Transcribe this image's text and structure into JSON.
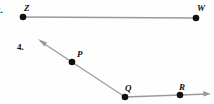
{
  "page": {
    "background_color": "#fefefe",
    "width": 214,
    "height": 104
  },
  "style": {
    "line_color": "#9a9a9a",
    "point_color": "#111111",
    "label_color": "#111111",
    "line_width": 1.3,
    "point_radius": 3.2
  },
  "problems": [
    {
      "number": "2.",
      "number_clipped": true,
      "figure_type": "segment",
      "points": [
        {
          "label": "Z",
          "x": 23,
          "y": 17,
          "label_x": 24,
          "label_y": 4
        },
        {
          "label": "W",
          "x": 196,
          "y": 18,
          "label_x": 197,
          "label_y": 4
        }
      ],
      "arrows": []
    },
    {
      "number": "4.",
      "number_clipped": false,
      "number_x": 17,
      "number_y": 43,
      "figure_type": "bent-ray",
      "points": [
        {
          "label": "P",
          "x": 72,
          "y": 62,
          "label_x": 77,
          "label_y": 50
        },
        {
          "label": "Q",
          "x": 125,
          "y": 97,
          "label_x": 125,
          "label_y": 84
        },
        {
          "label": "R",
          "x": 180,
          "y": 95,
          "label_x": 179,
          "label_y": 83
        }
      ],
      "arrows": [
        {
          "name": "upper-left-arrow",
          "tip_x": 38,
          "tip_y": 39
        },
        {
          "name": "right-arrow",
          "tip_x": 210,
          "tip_y": 94
        }
      ]
    }
  ]
}
